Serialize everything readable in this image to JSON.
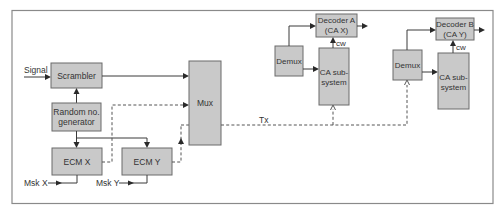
{
  "diagram": {
    "title": "",
    "colors": {
      "box_fill": "#c9c9c9",
      "box_stroke": "#6a6a6a",
      "line": "#3a3a3a",
      "frame": "#8a8a8a"
    },
    "blocks": {
      "scrambler": "Scrambler",
      "random_gen_line1": "Random no.",
      "random_gen_line2": "generator",
      "ecm_x": "ECM X",
      "ecm_y": "ECM Y",
      "mux": "Mux",
      "demux_a": "Demux",
      "demux_b": "Demux",
      "decoder_a_line1": "Decoder A",
      "decoder_a_line2": "(CA X)",
      "decoder_b_line1": "Decoder B",
      "decoder_b_line2": "(CA Y)",
      "ca_a_line1": "CA sub-",
      "ca_a_line2": "system",
      "ca_b_line1": "CA sub-",
      "ca_b_line2": "system"
    },
    "signals": {
      "signal_in": "Signal",
      "msk_x": "Msk X",
      "msk_y": "Msk Y",
      "tx": "Tx",
      "cw_a": "cw",
      "cw_b": "cw"
    }
  }
}
